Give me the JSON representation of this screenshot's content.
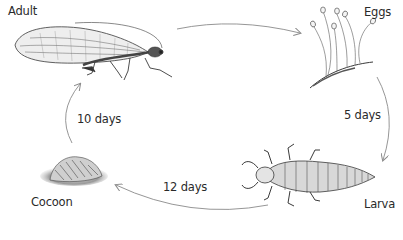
{
  "diagram": {
    "type": "life-cycle",
    "stages": [
      {
        "id": "adult",
        "label": "Adult"
      },
      {
        "id": "eggs",
        "label": "Eggs"
      },
      {
        "id": "larva",
        "label": "Larva"
      },
      {
        "id": "cocoon",
        "label": "Cocoon"
      }
    ],
    "transitions": [
      {
        "from": "adult",
        "to": "eggs",
        "label": ""
      },
      {
        "from": "eggs",
        "to": "larva",
        "label": "5 days"
      },
      {
        "from": "larva",
        "to": "cocoon",
        "label": "12 days"
      },
      {
        "from": "cocoon",
        "to": "adult",
        "label": "10 days"
      }
    ],
    "colors": {
      "background": "#ffffff",
      "text": "#2a2a2a",
      "arrow": "#8a8a8a",
      "drawing": "#3a3a3a"
    }
  }
}
